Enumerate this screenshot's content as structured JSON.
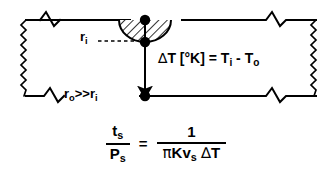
{
  "figure": {
    "type": "scientific-schematic",
    "background_color": "#ffffff",
    "line_color": "#000000",
    "hatch_color": "#000000"
  },
  "diagram": {
    "medium_label_ri": "r",
    "labels": {
      "inner_radius": {
        "text_main": "r",
        "text_sub": "i",
        "full": "r_i"
      },
      "radius_relation": {
        "text": "r_o >> r_i",
        "outer_main": "r",
        "outer_sub": "o",
        "relation": ">>",
        "inner_main": "r",
        "inner_sub": "i"
      },
      "delta_t": {
        "full": "∆T [°K] = T_i - T_o",
        "delta": "∆",
        "t": "T",
        "units": "[°K]",
        "equals": "=",
        "t_inner_main": "T",
        "t_inner_sub": "i",
        "minus": "-",
        "t_outer_main": "T",
        "t_outer_sub": "o"
      }
    },
    "markers": {
      "node_count": 3,
      "arrow_direction": "down",
      "leader_line_style": "dashed"
    },
    "boundary": {
      "top_edge": "line-with-zigzag-break",
      "bottom_edge": "line-with-zigzag-break",
      "left_edge": "fine-zigzag",
      "right_edge": "fine-zigzag"
    }
  },
  "equation": {
    "left": {
      "numerator_main": "t",
      "numerator_sub": "s",
      "denominator_main": "P",
      "denominator_sub": "s"
    },
    "operator": "=",
    "right": {
      "numerator": "1",
      "denominator_pi": "π",
      "denominator_k": "K",
      "denominator_v_main": "v",
      "denominator_v_sub": "s",
      "denominator_delta": "∆",
      "denominator_t": "T"
    },
    "plain_text": "t_s / P_s = 1 / (π K v_s ∆T)"
  }
}
